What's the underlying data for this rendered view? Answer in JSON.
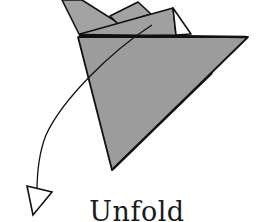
{
  "diagram": {
    "caption": "Unfold",
    "colors": {
      "paper_fill": "#9c9c9c",
      "paper_back": "#a3a3a3",
      "stroke": "#111111",
      "background": "#ffffff",
      "flap_white": "#ffffff"
    },
    "elements": [
      {
        "name": "back-flap-left",
        "shape": "triangle"
      },
      {
        "name": "middle-small-flap",
        "shape": "quad"
      },
      {
        "name": "middle-flap",
        "shape": "quad"
      },
      {
        "name": "white-inner-triangle",
        "shape": "triangle"
      },
      {
        "name": "main-front-triangle",
        "shape": "triangle"
      },
      {
        "name": "unfold-arrow",
        "shape": "curved-arrow",
        "direction": "down-left"
      }
    ]
  }
}
